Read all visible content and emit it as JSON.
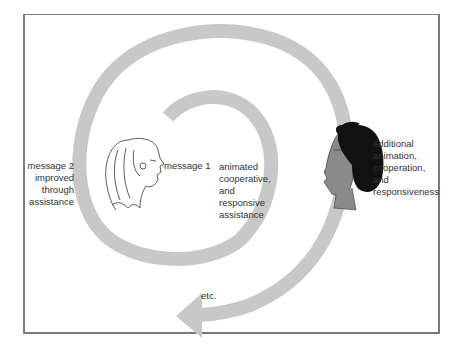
{
  "diagram": {
    "type": "spiral-interaction-diagram",
    "colors": {
      "spiral": "#c8c8c8",
      "frame": "#7a7a7a",
      "text": "#333333",
      "face_right_skin": "#8a8a8a",
      "face_right_hair": "#111111"
    },
    "figures": [
      {
        "name": "woman-face-left",
        "style": "line drawing"
      },
      {
        "name": "person-face-right",
        "style": "shaded, dark curly hair"
      }
    ],
    "labels": {
      "message_2": [
        "message 2",
        "improved",
        "through",
        "assistance"
      ],
      "message_1": [
        "message 1"
      ],
      "inner_assistance": [
        "animated",
        "cooperative,",
        "and",
        "responsive",
        "assistance"
      ],
      "additional": [
        "additional",
        "animation,",
        "cooperation,",
        "and",
        "responsiveness"
      ],
      "etc": "etc."
    }
  }
}
